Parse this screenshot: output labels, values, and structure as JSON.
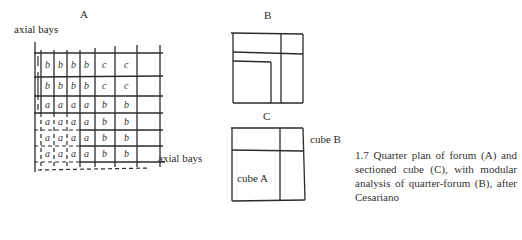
{
  "figure": {
    "panels": {
      "A": {
        "letter": "A",
        "top_label": "axial bays",
        "side_label": "axial bays"
      },
      "B": {
        "letter": "B"
      },
      "C": {
        "letter": "C",
        "cube_a_label": "cube A",
        "cube_b_label": "cube B"
      }
    },
    "grid_A": {
      "rows": [
        [
          "b",
          "b",
          "b",
          "b",
          "c",
          "c"
        ],
        [
          "b",
          "b",
          "b",
          "b",
          "c",
          "c"
        ],
        [
          "a",
          "a",
          "a",
          "a",
          "b",
          "b"
        ],
        [
          "a",
          "a",
          "a",
          "a",
          "b",
          "b"
        ],
        [
          "a",
          "a",
          "a",
          "a",
          "b",
          "b"
        ],
        [
          "a",
          "a",
          "a",
          "a",
          "b",
          "b"
        ],
        [
          "a",
          "a",
          "a",
          "a",
          "b",
          "b"
        ]
      ]
    },
    "caption": "1.7 Quarter plan of forum (A) and sectioned cube (C), with modular analysis of quarter-forum (B), after Cesariano"
  }
}
